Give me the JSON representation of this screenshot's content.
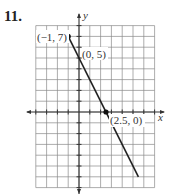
{
  "problem_number": "11.",
  "chart_data": {
    "type": "line",
    "title": "",
    "xlabel": "x",
    "ylabel": "y",
    "xlim": [
      -4,
      7
    ],
    "ylim": [
      -7,
      8
    ],
    "grid": true,
    "grid_step": 1,
    "series": [
      {
        "name": "line",
        "x": [
          -1,
          5.5
        ],
        "y": [
          7,
          -6
        ],
        "start_endpoint_closed": true,
        "color": "#222222"
      }
    ],
    "points": [
      {
        "x": -1,
        "y": 7,
        "label": "(−1, 7)",
        "marked": true
      },
      {
        "x": 0,
        "y": 5,
        "label": "(0, 5)",
        "marked": false
      },
      {
        "x": 2.5,
        "y": 0,
        "label": "(2.5, 0)",
        "marked": true
      }
    ]
  },
  "labels": {
    "p1": "(−1, 7)",
    "p2": "(0, 5)",
    "p3": "(2.5, 0)",
    "x_axis": "x",
    "y_axis": "y"
  }
}
